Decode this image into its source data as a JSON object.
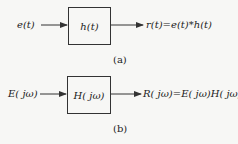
{
  "diagram_a": {
    "input": "e(t)",
    "block": "h(t)",
    "output": "r(t)=e(t)*h(t)",
    "caption": "(a)"
  },
  "diagram_b": {
    "input": "E( jω)",
    "block": "H( jω)",
    "output": "R( jω)=E( jω)H( jω)",
    "caption": "(b)"
  },
  "colors": {
    "line": "#333333",
    "background": "#f7f7f5"
  }
}
